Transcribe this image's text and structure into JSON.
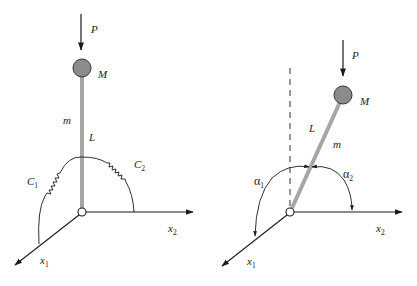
{
  "figures": {
    "left": {
      "load_label": "P",
      "mass_label": "M",
      "rod_mass_label": "m",
      "length_label": "L",
      "spring1_label": "C",
      "spring1_sub": "1",
      "spring2_label": "C",
      "spring2_sub": "2",
      "axis1_label": "x",
      "axis1_sub": "1",
      "axis2_label": "x",
      "axis2_sub": "2"
    },
    "right": {
      "load_label": "P",
      "mass_label": "M",
      "rod_mass_label": "m",
      "length_label": "L",
      "angle1_label": "α",
      "angle1_sub": "1",
      "angle2_label": "α",
      "angle2_sub": "2",
      "axis1_label": "x",
      "axis1_sub": "1",
      "axis2_label": "x",
      "axis2_sub": "2"
    }
  },
  "colors": {
    "rod": "#a6a6a6",
    "mass": "#8c8c8c",
    "line": "#1a1a1a"
  }
}
